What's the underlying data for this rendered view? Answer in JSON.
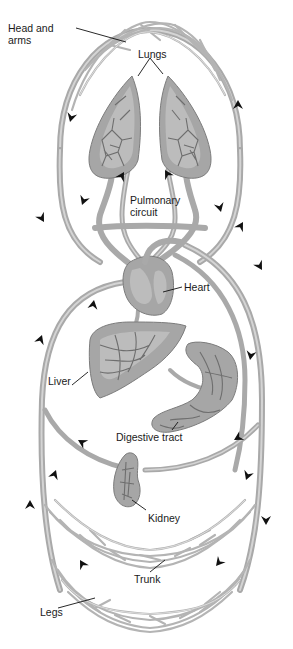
{
  "diagram": {
    "type": "circulatory-system",
    "labels": {
      "head_and_arms": "Head and\narms",
      "head_and_arms_line1": "Head and",
      "head_and_arms_line2": "arms",
      "lungs": "Lungs",
      "pulmonary_circuit_line1": "Pulmonary",
      "pulmonary_circuit_line2": "circuit",
      "heart": "Heart",
      "liver": "Liver",
      "digestive_tract": "Digestive tract",
      "kidney": "Kidney",
      "trunk": "Trunk",
      "legs": "Legs"
    },
    "colors": {
      "vessel": "#a9a9a9",
      "organ": "#a6a6a6",
      "arrow": "#111111",
      "label": "#1a1a1a",
      "background": "#ffffff"
    }
  }
}
